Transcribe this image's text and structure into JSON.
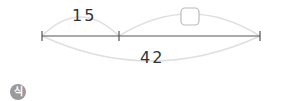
{
  "diagram": {
    "segment_left_label": "15",
    "segment_right_label": "",
    "total_label": "42",
    "unknown_box": "blank answer box",
    "colors": {
      "line": "#555555",
      "arc": "#dddddd",
      "box_border": "#bbbbbb"
    }
  },
  "badge": {
    "label": "식"
  }
}
